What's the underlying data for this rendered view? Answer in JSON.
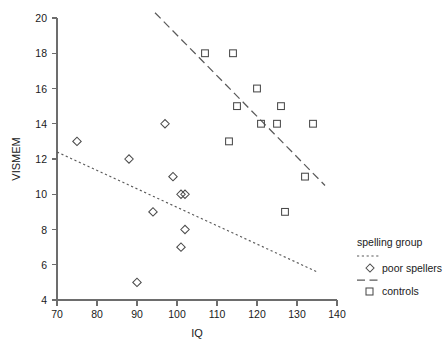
{
  "chart_data": {
    "type": "scatter",
    "title": "",
    "xlabel": "IQ",
    "ylabel": "VISMEM",
    "xlim": [
      70,
      140
    ],
    "ylim": [
      4,
      20
    ],
    "xticks": [
      70,
      80,
      90,
      100,
      110,
      120,
      130,
      140
    ],
    "yticks": [
      4,
      6,
      8,
      10,
      12,
      14,
      16,
      18,
      20
    ],
    "grid": false,
    "legend_position": "right",
    "legend_title": "spelling group",
    "series": [
      {
        "name": "poor spellers",
        "marker": "diamond",
        "line_style": "dotted",
        "color": "#4a4a4a",
        "points": [
          {
            "x": 75,
            "y": 13
          },
          {
            "x": 88,
            "y": 12
          },
          {
            "x": 90,
            "y": 5
          },
          {
            "x": 94,
            "y": 9
          },
          {
            "x": 97,
            "y": 14
          },
          {
            "x": 99,
            "y": 11
          },
          {
            "x": 101,
            "y": 10
          },
          {
            "x": 101,
            "y": 7
          },
          {
            "x": 102,
            "y": 10
          },
          {
            "x": 102,
            "y": 8
          }
        ],
        "fit_line": {
          "x1": 70,
          "y1": 12.4,
          "x2": 135,
          "y2": 5.6
        }
      },
      {
        "name": "controls",
        "marker": "square",
        "line_style": "dashed",
        "color": "#4a4a4a",
        "points": [
          {
            "x": 107,
            "y": 18
          },
          {
            "x": 113,
            "y": 13
          },
          {
            "x": 114,
            "y": 18
          },
          {
            "x": 115,
            "y": 15
          },
          {
            "x": 120,
            "y": 16
          },
          {
            "x": 121,
            "y": 14
          },
          {
            "x": 125,
            "y": 14
          },
          {
            "x": 126,
            "y": 15
          },
          {
            "x": 127,
            "y": 9
          },
          {
            "x": 132,
            "y": 11
          },
          {
            "x": 134,
            "y": 14
          }
        ],
        "fit_line": {
          "x1": 94.5,
          "y1": 20.3,
          "x2": 137,
          "y2": 10.5
        }
      }
    ]
  },
  "legend": {
    "title": "spelling group",
    "entries": [
      {
        "label": "poor spellers",
        "marker": "diamond",
        "line": "dotted"
      },
      {
        "label": "controls",
        "marker": "square",
        "line": "dashed"
      }
    ]
  },
  "axes": {
    "x_title": "IQ",
    "y_title": "VISMEM",
    "x_tick_labels": [
      "70",
      "80",
      "90",
      "100",
      "110",
      "120",
      "130",
      "140"
    ],
    "y_tick_labels": [
      "4",
      "6",
      "8",
      "10",
      "12",
      "14",
      "16",
      "18",
      "20"
    ]
  }
}
